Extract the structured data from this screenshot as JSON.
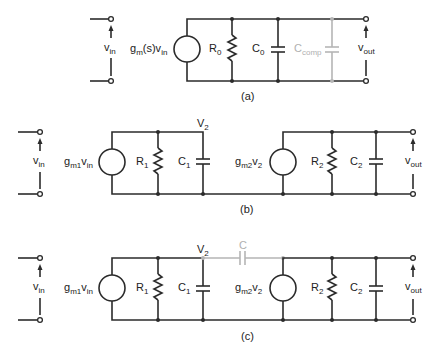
{
  "diagrams": [
    {
      "id": "a",
      "caption": "(a)",
      "input_label": {
        "main": "v",
        "sub": "in"
      },
      "output_label": {
        "main": "v",
        "sub": "out"
      },
      "source_label": {
        "main": "g",
        "sub": "m",
        "mid": "(s)v",
        "sub2": "in"
      },
      "components": [
        {
          "type": "resistor",
          "label": "R",
          "sub": "0"
        },
        {
          "type": "capacitor",
          "label": "C",
          "sub": "0"
        },
        {
          "type": "capacitor",
          "label": "C",
          "sub": "comp",
          "highlight": true
        }
      ]
    },
    {
      "id": "b",
      "caption": "(b)",
      "input_label": {
        "main": "v",
        "sub": "in"
      },
      "output_label": {
        "main": "v",
        "sub": "out"
      },
      "node_label": {
        "main": "V",
        "sub": "2"
      },
      "source1_label": {
        "main": "g",
        "sub": "m1",
        "mid": "v",
        "sub2": "in"
      },
      "source2_label": {
        "main": "g",
        "sub": "m2",
        "mid": "v",
        "sub2": "2"
      },
      "components": [
        {
          "type": "resistor",
          "label": "R",
          "sub": "1"
        },
        {
          "type": "capacitor",
          "label": "C",
          "sub": "1"
        },
        {
          "type": "resistor",
          "label": "R",
          "sub": "2"
        },
        {
          "type": "capacitor",
          "label": "C",
          "sub": "2"
        }
      ]
    },
    {
      "id": "c",
      "caption": "(c)",
      "input_label": {
        "main": "v",
        "sub": "in"
      },
      "output_label": {
        "main": "v",
        "sub": "out"
      },
      "node_label": {
        "main": "V",
        "sub": "2"
      },
      "source1_label": {
        "main": "g",
        "sub": "m1",
        "mid": "v",
        "sub2": "in"
      },
      "source2_label": {
        "main": "g",
        "sub": "m2",
        "mid": "v",
        "sub2": "2"
      },
      "components": [
        {
          "type": "resistor",
          "label": "R",
          "sub": "1"
        },
        {
          "type": "capacitor",
          "label": "C",
          "sub": "1"
        },
        {
          "type": "capacitor",
          "label": "C",
          "sub": "",
          "highlight": true
        },
        {
          "type": "resistor",
          "label": "R",
          "sub": "2"
        },
        {
          "type": "capacitor",
          "label": "C",
          "sub": "2"
        }
      ]
    }
  ],
  "colors": {
    "wire": "#2b2b2b",
    "highlight": "#b5b5b5",
    "background": "#ffffff"
  }
}
